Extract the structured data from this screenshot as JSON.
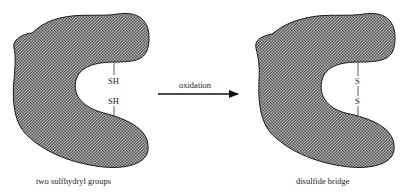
{
  "diagram": {
    "left_panel": {
      "groups": [
        "SH",
        "SH"
      ],
      "caption": "two sulfhydryl groups"
    },
    "arrow": {
      "label": "oxidation"
    },
    "right_panel": {
      "groups": [
        "S",
        "S"
      ],
      "caption": "disulfide bridge"
    },
    "colors": {
      "protein_fill": "#8a8a8a",
      "outline": "#1a1a1a",
      "text": "#222222"
    }
  }
}
